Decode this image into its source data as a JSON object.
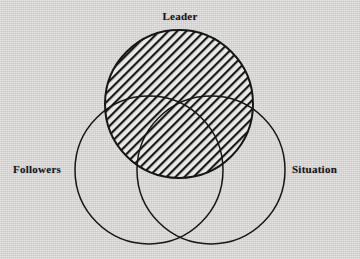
{
  "figure": {
    "type": "venn-diagram",
    "background_color": "#d6d5d2",
    "stroke_color": "#161616",
    "hatch_color": "#161616",
    "hatch_fill_background": "#e8e8e6",
    "label_color": "#15161a"
  },
  "labels": {
    "leader": "Leader",
    "followers": "Followers",
    "situation": "Situation"
  },
  "chart_data": {
    "type": "venn",
    "title": "",
    "sets": [
      {
        "name": "Leader",
        "label": "Leader",
        "cx": 179,
        "cy": 104,
        "r": 74,
        "fill": "hatched",
        "hatch_angle_deg": 45,
        "hatch_spacing_px": 4.5,
        "label_position": "top"
      },
      {
        "name": "Followers",
        "label": "Followers",
        "cx": 149,
        "cy": 170,
        "r": 74,
        "fill": "none",
        "label_position": "left"
      },
      {
        "name": "Situation",
        "label": "Situation",
        "cx": 211,
        "cy": 170,
        "r": 74,
        "fill": "none",
        "label_position": "right"
      }
    ],
    "highlighted_set": "Leader",
    "legend": false,
    "grid": false
  }
}
